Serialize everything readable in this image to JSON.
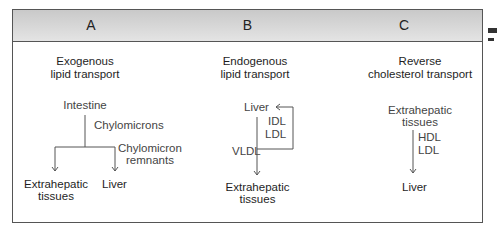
{
  "panels": [
    {
      "header": "A",
      "title_line1": "Exogenous",
      "title_line2": "lipid transport",
      "source": "Intestine",
      "carrier": "Chylomicrons",
      "remnant_label_line1": "Chylomicron",
      "remnant_label_line2": "remnants",
      "target_left_line1": "Extrahepatic",
      "target_left_line2": "tissues",
      "target_right": "Liver"
    },
    {
      "header": "B",
      "title_line1": "Endogenous",
      "title_line2": "lipid transport",
      "source": "Liver",
      "return_label_line1": "IDL",
      "return_label_line2": "LDL",
      "carrier": "VLDL",
      "target_line1": "Extrahepatic",
      "target_line2": "tissues"
    },
    {
      "header": "C",
      "title_line1": "Reverse",
      "title_line2": "cholesterol transport",
      "source_line1": "Extrahepatic",
      "source_line2": "tissues",
      "carrier_line1": "HDL",
      "carrier_line2": "LDL",
      "target": "Liver"
    }
  ],
  "colors": {
    "border": "#555555",
    "header_top": "#c9c9c9",
    "header_bottom": "#e4e4e4",
    "text": "#1e1e1e"
  }
}
